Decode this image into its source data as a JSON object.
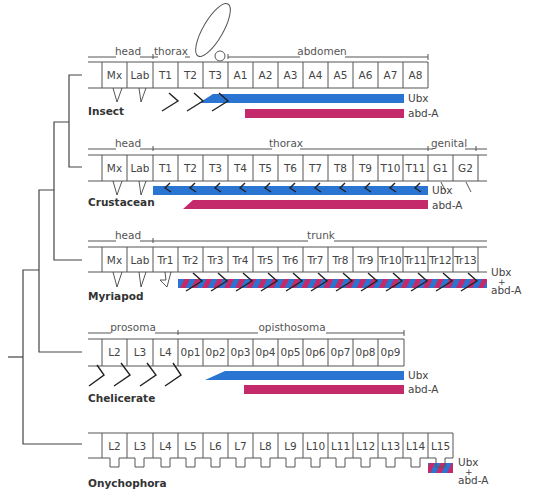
{
  "colors": {
    "ubx": "#2a74d2",
    "abda": "#c42a6a",
    "line": "#555555"
  },
  "legend": {
    "ubx": "Ubx",
    "abda": "abd-A",
    "combined_top": "Ubx",
    "combined_plus": "+",
    "combined_bottom": "abd-A"
  },
  "taxa": [
    {
      "name": "Insect",
      "regions": [
        {
          "label": "head",
          "x1": 88,
          "x2": 153
        },
        {
          "label": "thorax",
          "x1": 153,
          "x2": 228
        },
        {
          "label": "abdomen",
          "x1": 228,
          "x2": 428
        }
      ],
      "segments": [
        "Mx",
        "Lab",
        "T1",
        "T2",
        "T3",
        "A1",
        "A2",
        "A3",
        "A4",
        "A5",
        "A6",
        "A7",
        "A8"
      ],
      "expression": {
        "ubx_start_segment": "T3",
        "abda_start_segment": "A1",
        "end_segment": "A7"
      }
    },
    {
      "name": "Crustacean",
      "regions": [
        {
          "label": "head",
          "x1": 88,
          "x2": 153
        },
        {
          "label": "thorax",
          "x1": 153,
          "x2": 428
        },
        {
          "label": "genital",
          "x1": 428,
          "x2": 487
        }
      ],
      "segments": [
        "Mx",
        "Lab",
        "T1",
        "T2",
        "T3",
        "T4",
        "T5",
        "T6",
        "T7",
        "T8",
        "T9",
        "T10",
        "T11",
        "G1",
        "G2"
      ],
      "expression": {
        "ubx_start_segment": "T1",
        "abda_start_segment": "T2",
        "end_segment": "T11"
      }
    },
    {
      "name": "Myriapod",
      "regions": [
        {
          "label": "head",
          "x1": 88,
          "x2": 153
        },
        {
          "label": "trunk",
          "x1": 153,
          "x2": 487
        }
      ],
      "segments": [
        "Mx",
        "Lab",
        "Tr1",
        "Tr2",
        "Tr3",
        "Tr4",
        "Tr5",
        "Tr6",
        "Tr7",
        "Tr8",
        "Tr9",
        "Tr10",
        "Tr11",
        "Tr12",
        "Tr13"
      ],
      "expression": {
        "combined_start_segment": "Tr2",
        "end_segment": "Tr13",
        "combined": true
      }
    },
    {
      "name": "Chelicerate",
      "regions": [
        {
          "label": "prosoma",
          "x1": 88,
          "x2": 178
        },
        {
          "label": "opisthosoma",
          "x1": 178,
          "x2": 404
        }
      ],
      "segments": [
        "L2",
        "L3",
        "L4",
        "0p1",
        "0p2",
        "0p3",
        "0p4",
        "0p5",
        "0p6",
        "0p7",
        "0p8",
        "0p9"
      ],
      "expression": {
        "ubx_start_segment": "0p2",
        "abda_start_segment": "0p3",
        "end_segment": "0p9"
      }
    },
    {
      "name": "Onychophora",
      "regions": [],
      "segments": [
        "L2",
        "L3",
        "L4",
        "L5",
        "L6",
        "L7",
        "L8",
        "L9",
        "L10",
        "L11",
        "L12",
        "L13",
        "L14",
        "L15"
      ],
      "expression": {
        "combined_start_segment": "L15",
        "end_segment": "L15",
        "combined": true
      }
    }
  ],
  "tree": "((((Insect, Crustacean), Myriapod), Chelicerate), Onychophora)"
}
